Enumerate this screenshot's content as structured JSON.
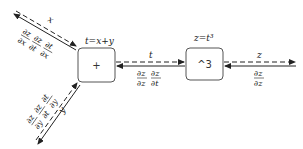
{
  "nodes": {
    "plus": {
      "label": "+",
      "equation": "t=x+y"
    },
    "cube": {
      "label": "^3",
      "equation": "z=t³"
    }
  },
  "edges": {
    "x": {
      "forward": "x",
      "grads": [
        {
          "num": "∂z",
          "den": "∂x"
        },
        {
          "num": "∂z",
          "den": "∂t"
        },
        {
          "num": "∂t",
          "den": "∂x"
        }
      ]
    },
    "y": {
      "forward": "y",
      "grads": [
        {
          "num": "∂z",
          "den": "∂y"
        },
        {
          "num": "∂z",
          "den": "∂t"
        },
        {
          "num": "∂t",
          "den": "∂y"
        }
      ]
    },
    "t": {
      "forward": "t",
      "grads": [
        {
          "num": "∂z",
          "den": "∂z"
        },
        {
          "num": "∂z",
          "den": "∂t"
        }
      ]
    },
    "z": {
      "forward": "z",
      "grads": [
        {
          "num": "∂z",
          "den": "∂z"
        }
      ]
    }
  },
  "colors": {
    "line": "#222222",
    "box": "#555555"
  }
}
